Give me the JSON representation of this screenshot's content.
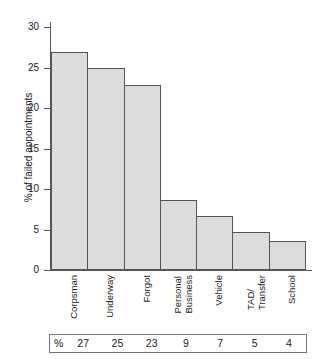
{
  "chart_data": {
    "type": "bar",
    "title": "",
    "xlabel": "",
    "ylabel": "% of failed appointments",
    "categories": [
      "Corpsman",
      "Underway",
      "Forgot",
      "Personal Business",
      "Vehicle",
      "TAD/ Transfer",
      "School"
    ],
    "category_lines": [
      [
        "Corpsman"
      ],
      [
        "Underway"
      ],
      [
        "Forgot"
      ],
      [
        "Personal",
        "Business"
      ],
      [
        "Vehicle"
      ],
      [
        "TAD/",
        "Transfer"
      ],
      [
        "School"
      ]
    ],
    "values": [
      26.9,
      24.9,
      22.9,
      8.7,
      6.7,
      4.7,
      3.6
    ],
    "ylim": [
      0,
      30
    ],
    "yticks": [
      0,
      5,
      10,
      15,
      20,
      25,
      30
    ],
    "ytick_labels": [
      "0",
      "5",
      "10",
      "15",
      "20",
      "25",
      "30"
    ],
    "grid": false,
    "legend": "none",
    "bar_fill_color": "#dcdcdc",
    "bar_border_color": "#555555",
    "axis_color": "#555555"
  },
  "value_table": {
    "percent_symbol": "%",
    "values": [
      "27",
      "25",
      "23",
      "9",
      "7",
      "5",
      "4"
    ]
  }
}
